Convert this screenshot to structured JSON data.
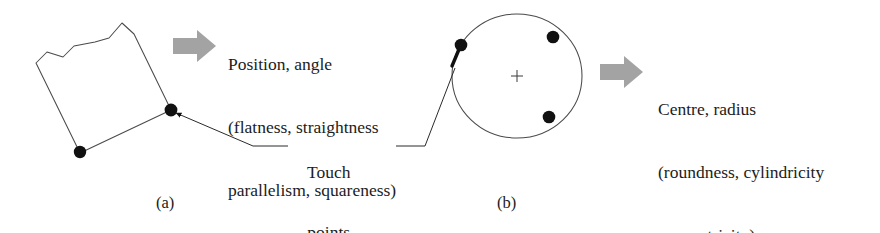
{
  "figure": {
    "background_color": "#ffffff",
    "line_color": "#3a3a3a",
    "dot_color": "#111111",
    "arrow_color": "#a0a0a0",
    "text_color": "#1c1c1c"
  },
  "panel_a": {
    "caption": "(a)",
    "shape_name": "irregular-quadrilateral",
    "touch_point_count": 2,
    "result_text": {
      "line1": "Position, angle",
      "line2": "(flatness, straightness",
      "line3": "parallelism, squareness)"
    }
  },
  "panel_b": {
    "caption": "(b)",
    "shape_name": "circle",
    "touch_point_count": 3,
    "center_marker": "+",
    "result_text": {
      "line1": "Centre, radius",
      "line2": "(roundness, cylindricity",
      "line3": "concentricity)"
    }
  },
  "annotation": {
    "touch_label_line1": "Touch",
    "touch_label_line2": "points"
  }
}
